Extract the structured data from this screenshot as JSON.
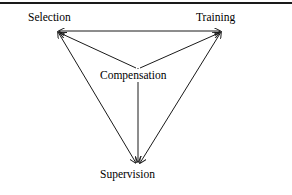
{
  "figure": {
    "type": "triangle-relationship-diagram",
    "background_color": "#ffffff",
    "line_color": "#1a1a1a",
    "text_color": "#000000",
    "top_rule": {
      "name": "horizontal-rule",
      "color": "#1a1a1a"
    },
    "nodes": [
      {
        "id": "selection",
        "label": "Selection",
        "position": "top-left"
      },
      {
        "id": "training",
        "label": "Training",
        "position": "top-right"
      },
      {
        "id": "compensation",
        "label": "Compensation",
        "position": "center"
      },
      {
        "id": "supervision",
        "label": "Supervision",
        "position": "bottom-center"
      }
    ],
    "edges": [
      {
        "from": "selection",
        "to": "training",
        "arrows": "both"
      },
      {
        "from": "selection",
        "to": "supervision",
        "arrows": "both"
      },
      {
        "from": "training",
        "to": "supervision",
        "arrows": "both"
      },
      {
        "from": "compensation",
        "to": "selection",
        "arrows": "end"
      },
      {
        "from": "compensation",
        "to": "training",
        "arrows": "end"
      },
      {
        "from": "compensation",
        "to": "supervision",
        "arrows": "end"
      }
    ]
  }
}
